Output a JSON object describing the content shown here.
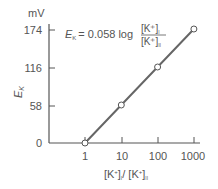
{
  "chart_data": {
    "type": "line",
    "title": "",
    "equation": "E_K = 0.058 log [K+]_I / [K+]_II",
    "equation_parts": {
      "lhs": "E",
      "lhs_sub": "K",
      "rhs": "= 0.058 log",
      "numerator": "[K⁺]",
      "numerator_sub": "I",
      "denominator": "[K⁺]",
      "denominator_sub": "II"
    },
    "xlabel": "[K⁺]I / [K⁺]II",
    "ylabel": "E_K",
    "yunit": "mV",
    "x_scale": "log",
    "x_ticks": [
      "1",
      "10",
      "100",
      "1000"
    ],
    "y_ticks": [
      "0",
      "58",
      "116",
      "174"
    ],
    "x": [
      1,
      10,
      100,
      1000
    ],
    "series": [
      {
        "name": "E_K",
        "values": [
          0,
          58,
          116,
          174
        ],
        "color": "#666666",
        "marker": "open-circle"
      }
    ],
    "ylim": [
      0,
      174
    ],
    "grid": false,
    "legend": "none"
  },
  "labels": {
    "yunit": "mV",
    "ylabel_main": "E",
    "ylabel_sub": "K",
    "xlabel_a": "[K",
    "xlabel_sup": "+",
    "xlabel_b": "]",
    "xlabel_sub1": "I",
    "xlabel_slash": "/ [K",
    "xlabel_sub2": "II"
  }
}
